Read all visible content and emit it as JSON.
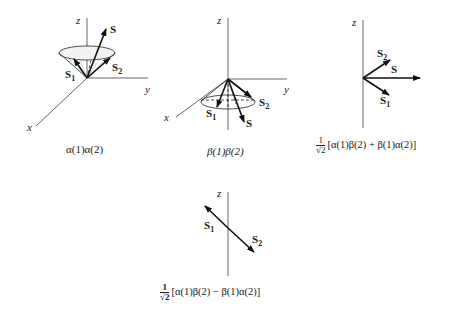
{
  "panels": [
    {
      "id": "alpha-alpha",
      "axes": [
        "z",
        "y",
        "x"
      ],
      "vectors": [
        "S",
        "S1",
        "S2"
      ],
      "labels": {
        "z": "z",
        "y": "y",
        "x": "x",
        "S": "S",
        "S1": "S",
        "S1_sub": "1",
        "S2": "S",
        "S2_sub": "2"
      },
      "caption": "α(1)α(2)"
    },
    {
      "id": "beta-beta",
      "axes": [
        "z",
        "y",
        "x"
      ],
      "vectors": [
        "S",
        "S1",
        "S2"
      ],
      "labels": {
        "z": "z",
        "y": "y",
        "x": "x",
        "S": "S",
        "S1": "S",
        "S1_sub": "1",
        "S2": "S",
        "S2_sub": "2"
      },
      "caption": "β(1)β(2)"
    },
    {
      "id": "triplet-zero",
      "axes": [
        "z"
      ],
      "vectors": [
        "S",
        "S1",
        "S2"
      ],
      "labels": {
        "z": "z",
        "S": "S",
        "S1": "S",
        "S1_sub": "1",
        "S2": "S",
        "S2_sub": "2"
      },
      "caption_prefix": {
        "num": "1",
        "den": "√2"
      },
      "caption": "[α(1)β(2) + β(1)α(2)]"
    },
    {
      "id": "singlet",
      "axes": [
        "z"
      ],
      "vectors": [
        "S1",
        "S2"
      ],
      "labels": {
        "z": "z",
        "S1": "S",
        "S1_sub": "1",
        "S2": "S",
        "S2_sub": "2"
      },
      "caption_prefix": {
        "num": "1",
        "den": "√2"
      },
      "caption": "[α(1)β(2) − β(1)α(2)]"
    }
  ]
}
